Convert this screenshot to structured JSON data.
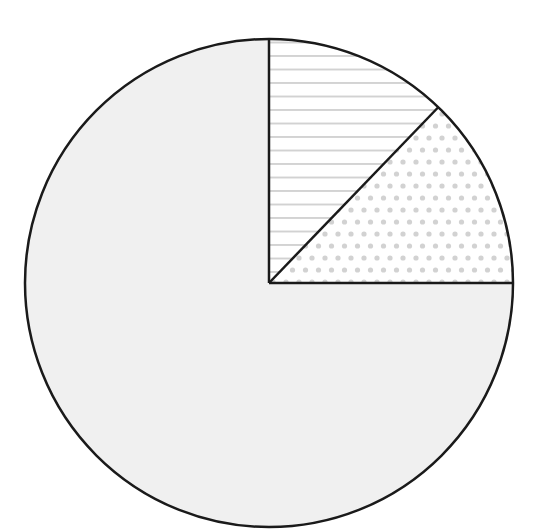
{
  "chart_data": {
    "type": "pie",
    "title": "",
    "labels": [
      "",
      "",
      ""
    ],
    "slices": [
      {
        "name": "striped",
        "value": 12.2,
        "pattern": "horizontal-lines",
        "fill": "#ffffff",
        "pattern_color": "#b8b8b8"
      },
      {
        "name": "dotted",
        "value": 12.8,
        "pattern": "dots",
        "fill": "#ffffff",
        "pattern_color": "#d2d2d2"
      },
      {
        "name": "solid-gray",
        "value": 75.0,
        "pattern": "solid",
        "fill": "#f0f0f0",
        "pattern_color": "#f0f0f0"
      }
    ],
    "values": [
      12.2,
      12.8,
      75.0
    ],
    "start_angle_deg": 90,
    "direction": "clockwise",
    "legend": "none",
    "outline_color": "#1a1a1a",
    "center": [
      269,
      283
    ],
    "radius": 244
  }
}
